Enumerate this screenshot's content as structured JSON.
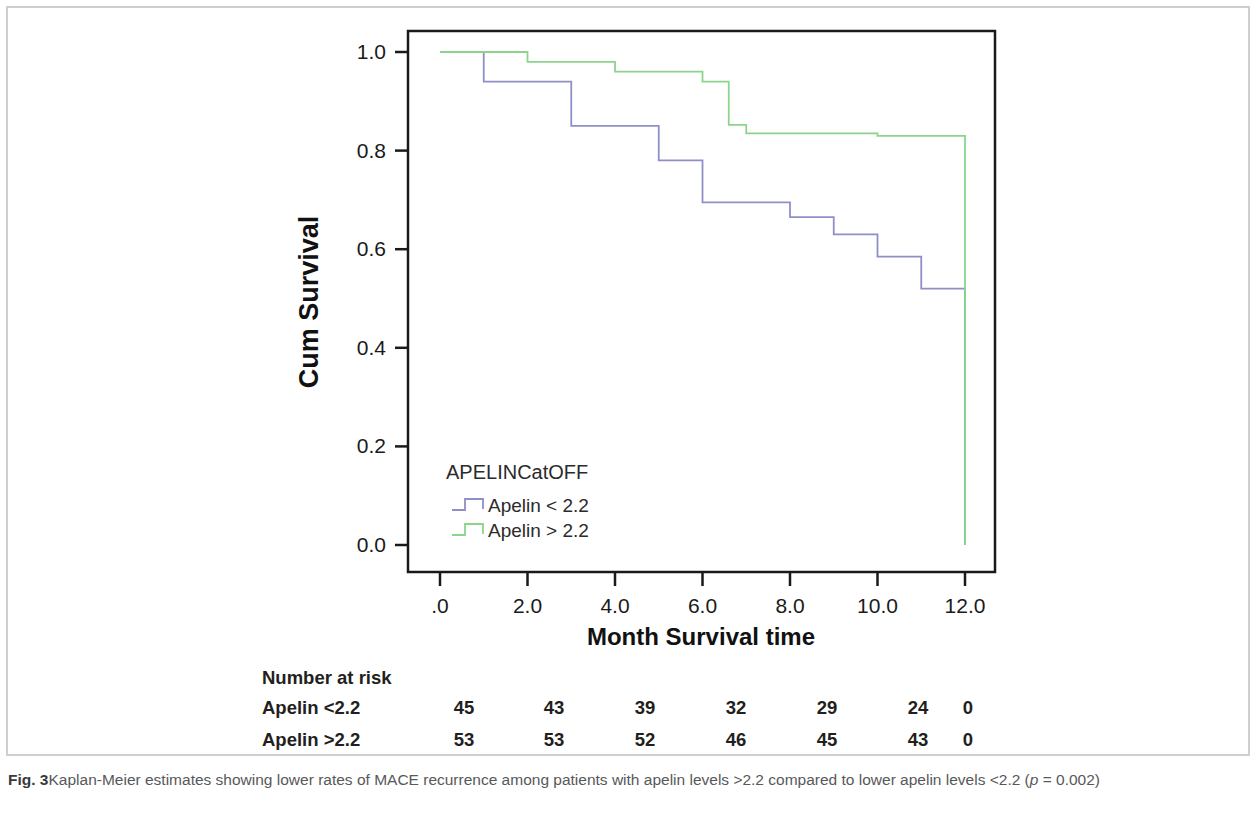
{
  "figure": {
    "label": "Fig. 3",
    "caption_text": "Kaplan-Meier estimates showing lower rates of MACE recurrence among patients with apelin levels >2.2 compared to lower apelin levels <2.2 (",
    "caption_p_italic": "p",
    "caption_tail": " = 0.002)"
  },
  "legend": {
    "title": "APELINCatOFF",
    "entries": [
      {
        "label": "Apelin < 2.2",
        "color": "#8f8fc8"
      },
      {
        "label": "Apelin > 2.2",
        "color": "#8cd48c"
      }
    ]
  },
  "risk_table": {
    "header": "Number at risk",
    "rows": [
      {
        "label": "Apelin <2.2",
        "values": [
          "45",
          "43",
          "39",
          "32",
          "29",
          "24",
          "0"
        ]
      },
      {
        "label": "Apelin >2.2",
        "values": [
          "53",
          "53",
          "52",
          "46",
          "45",
          "43",
          "0"
        ]
      }
    ],
    "time_points": [
      0,
      2,
      4,
      6,
      8,
      10,
      12
    ]
  },
  "chart_data": {
    "type": "line",
    "title": "",
    "xlabel": "Month Survival time",
    "ylabel": "Cum Survival",
    "xlim": [
      0,
      12
    ],
    "ylim": [
      0.0,
      1.0
    ],
    "xticks": [
      0,
      2,
      4,
      6,
      8,
      10,
      12
    ],
    "xticklabels": [
      ".0",
      "2.0",
      "4.0",
      "6.0",
      "8.0",
      "10.0",
      "12.0"
    ],
    "yticks": [
      0.0,
      0.2,
      0.4,
      0.6,
      0.8,
      1.0
    ],
    "yticklabels": [
      "0.0",
      "0.2",
      "0.4",
      "0.6",
      "0.8",
      "1.0"
    ],
    "grid": false,
    "legend_position": "lower-left-inside",
    "legend_title": "APELINCatOFF",
    "step_type": "post",
    "series": [
      {
        "name": "Apelin < 2.2",
        "color": "#8f8fc8",
        "x": [
          0,
          1,
          3,
          5,
          6,
          8,
          9,
          10,
          11,
          12,
          12
        ],
        "y": [
          1.0,
          0.94,
          0.85,
          0.78,
          0.695,
          0.665,
          0.63,
          0.585,
          0.52,
          0.495,
          0.0
        ]
      },
      {
        "name": "Apelin > 2.2",
        "color": "#8cd48c",
        "x": [
          0,
          2,
          4,
          6,
          6.6,
          7,
          10,
          12,
          12
        ],
        "y": [
          1.0,
          0.98,
          0.96,
          0.94,
          0.852,
          0.835,
          0.83,
          0.79,
          0.0
        ]
      }
    ]
  }
}
